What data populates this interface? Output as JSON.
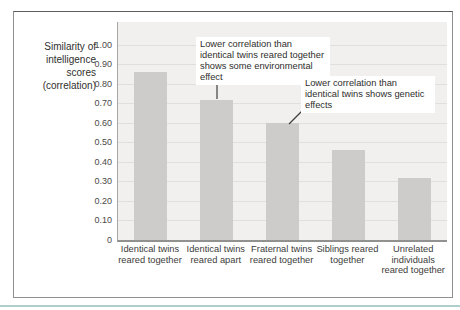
{
  "figure": {
    "frame_border_color": "#8f8f8f",
    "accent_line_color": "#b0cdd0",
    "plot_background": "#f1f0ee",
    "bar_color": "#cdccca",
    "gridline_color": "#e0dfdd",
    "text_color": "#3c3c3a"
  },
  "chart_data": {
    "type": "bar",
    "title": "",
    "ylabel": "Similarity of intelligence scores (correlation)",
    "xlabel": "",
    "categories": [
      "Identical twins reared together",
      "Identical twins reared apart",
      "Fraternal twins reared together",
      "Siblings reared together",
      "Unrelated individuals reared together"
    ],
    "values": [
      0.86,
      0.72,
      0.6,
      0.46,
      0.32
    ],
    "ylim": [
      0,
      1.0
    ],
    "ytick_step": 0.1,
    "ytick_labels": [
      "1.00",
      "0.90",
      "0.80",
      "0.70",
      "0.60",
      "0.50",
      "0.40",
      "0.30",
      "0.20",
      "0.10",
      "0"
    ],
    "grid": true,
    "legend": false,
    "annotations": [
      {
        "text": "Lower correlation than identical twins reared together shows some environmental effect",
        "target": "Identical twins reared apart"
      },
      {
        "text": "Lower correlation than identical twins shows genetic effects",
        "target": "Fraternal twins reared together"
      }
    ]
  }
}
